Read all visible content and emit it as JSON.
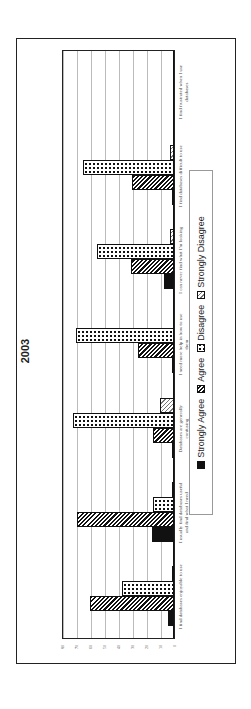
{
  "chart_data": {
    "type": "bar",
    "orientation": "vertical bars, whole chart rotated 90° counter-clockwise on page",
    "title": "2003",
    "xlabel": "",
    "ylabel": "",
    "ylim": [
      0,
      80
    ],
    "yticks": [
      0,
      10,
      20,
      30,
      40,
      50,
      60,
      70,
      80
    ],
    "grid": true,
    "legend_position": "bottom",
    "categories": [
      "I find databases enjoyable to use",
      "I usually find databases useful and find what I need",
      "Databases are generally confusing",
      "I need more help in how to use them",
      "I can never find what I'm looking",
      "I find databases difficult to use",
      "I find frustrated when I use databases"
    ],
    "series": [
      {
        "name": "Strongly Agree",
        "pattern": "solid-black",
        "values": [
          4,
          16,
          1,
          1,
          7,
          1,
          0
        ]
      },
      {
        "name": "Agree",
        "pattern": "diagonal-hatch",
        "values": [
          60,
          69,
          15,
          26,
          31,
          30,
          0
        ]
      },
      {
        "name": "Disagree",
        "pattern": "dots",
        "values": [
          37,
          15,
          72,
          70,
          55,
          65,
          0
        ]
      },
      {
        "name": "Strongly Disagree",
        "pattern": "light-cross-hatch",
        "values": [
          1,
          1,
          10,
          0,
          3,
          3,
          0
        ]
      }
    ]
  },
  "title": "2003",
  "yticks": [
    "0",
    "10",
    "20",
    "30",
    "40",
    "50",
    "60",
    "70",
    "80"
  ],
  "categories": [
    "I find databases enjoyable to use",
    "I usually find databases useful and find what I need",
    "Databases are generally confusing",
    "I need more help in how to use them",
    "I can never find what I'm looking",
    "I find databases difficult to use",
    "I find frustrated when I use databases"
  ],
  "legend": [
    "Strongly Agree",
    "Agree",
    "Disagree",
    "Strongly Disagree"
  ]
}
